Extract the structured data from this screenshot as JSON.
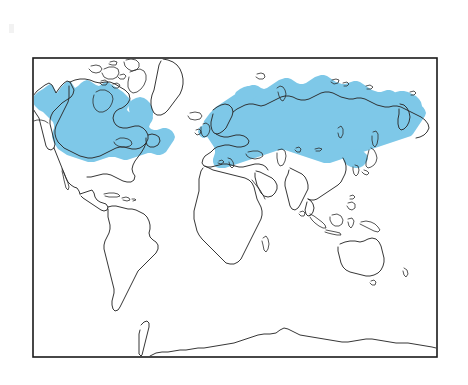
{
  "figure": {
    "type": "distribution-map",
    "projection": "rectangular world map",
    "background_color": "#ffffff",
    "frame": {
      "stroke_color": "#1a1a1a",
      "x": 33,
      "y": 58,
      "width": 404,
      "height": 299
    },
    "coastline": {
      "stroke_color": "#2b2b2b",
      "fill_color": "#ffffff"
    },
    "legend_present": false,
    "labels_present": false,
    "axis_labels_present": false
  },
  "range": {
    "name": "shaded-distribution-range",
    "fill_color": "#7ec8e8",
    "description": "Holarctic circumboreal range shaded across northern North America and northern Eurasia",
    "regions": [
      {
        "name": "nearctic-range",
        "label": "Alaska, Canada and northern United States",
        "shaded": true
      },
      {
        "name": "palearctic-range",
        "label": "Scandinavia, European Russia, Siberia and northern China",
        "shaded": true
      }
    ]
  },
  "landmasses": [
    {
      "name": "north-america",
      "label": "North America",
      "shaded": true
    },
    {
      "name": "greenland",
      "label": "Greenland",
      "shaded": false
    },
    {
      "name": "canadian-arctic-archipelago",
      "label": "Canadian Arctic Archipelago",
      "shaded": false
    },
    {
      "name": "iceland",
      "label": "Iceland",
      "shaded": false
    },
    {
      "name": "south-america",
      "label": "South America",
      "shaded": false
    },
    {
      "name": "africa",
      "label": "Africa",
      "shaded": false
    },
    {
      "name": "europe",
      "label": "Europe",
      "shaded": true
    },
    {
      "name": "asia",
      "label": "Asia",
      "shaded": true
    },
    {
      "name": "japan",
      "label": "Japan",
      "shaded": false
    },
    {
      "name": "india",
      "label": "India",
      "shaded": false
    },
    {
      "name": "southeast-asia-islands",
      "label": "Southeast Asian islands",
      "shaded": false
    },
    {
      "name": "new-guinea",
      "label": "New Guinea",
      "shaded": false
    },
    {
      "name": "australia",
      "label": "Australia",
      "shaded": false
    },
    {
      "name": "tasmania",
      "label": "Tasmania",
      "shaded": false
    },
    {
      "name": "antarctica",
      "label": "Antarctica",
      "shaded": false
    },
    {
      "name": "madagascar",
      "label": "Madagascar",
      "shaded": false
    },
    {
      "name": "british-isles",
      "label": "British Isles",
      "shaded": true
    }
  ]
}
